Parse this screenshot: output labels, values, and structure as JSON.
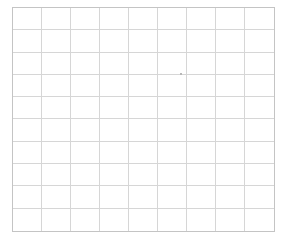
{
  "grid": {
    "columns": 9,
    "rows": 10,
    "line_color": "#d6d6d6",
    "border_color": "#c4c4c4",
    "background": "#ffffff"
  },
  "marker": {
    "x": 180,
    "y": 73,
    "color": "#b8b8b8"
  }
}
